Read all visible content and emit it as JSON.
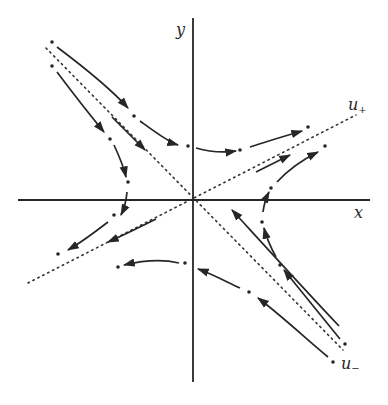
{
  "diagram": {
    "type": "phase-portrait",
    "labels": {
      "y_axis": "y",
      "x_axis": "x",
      "unstable_manifold": "u",
      "unstable_subscript": "+",
      "stable_manifold": "u",
      "stable_subscript": "−"
    },
    "colors": {
      "ink": "#262626",
      "background": "#ffffff"
    },
    "origin": [
      193,
      200
    ],
    "axes": {
      "x": {
        "from": [
          18,
          200
        ],
        "to": [
          370,
          200
        ]
      },
      "y": {
        "from": [
          193,
          18
        ],
        "to": [
          193,
          382
        ]
      }
    },
    "manifolds": {
      "u_plus": {
        "from": [
          28,
          283
        ],
        "to": [
          356,
          115
        ],
        "style": "dotted"
      },
      "u_minus": {
        "from": [
          46,
          48
        ],
        "to": [
          343,
          350
        ],
        "style": "dotted"
      }
    },
    "trajectories": [
      {
        "id": "upper-left-to-upper-right",
        "path": "M56,46 C90,70 110,90 128,110 M140,118 C160,132 170,140 180,146 M198,148 C210,150 225,152 235,152 M248,148 C265,142 285,136 305,130",
        "start_point": [
          52,
          42
        ],
        "mid_points": [
          [
            134,
            115
          ],
          [
            188,
            147
          ],
          [
            240,
            150
          ]
        ],
        "end_point": [
          308,
          126
        ]
      },
      {
        "id": "left-upper-to-left-lower",
        "path": "M56,71 C70,90 90,115 105,133 M113,145 C120,160 125,175 126,185 M127,200 C125,210 122,215 118,219",
        "start_point": [
          52,
          67
        ],
        "mid_points": [
          [
            109,
            139
          ],
          [
            128,
            182
          ]
        ],
        "end_point": [
          118,
          219
        ]
      },
      {
        "id": "along-u-minus-in",
        "path": "M112,117 C130,135 138,143 145,150",
        "start_point": [
          112,
          117
        ],
        "end_point": [
          147,
          153
        ]
      },
      {
        "id": "lower-left-branch",
        "path": "M110,222 C95,235 80,245 66,252",
        "start_point": [
          114,
          215
        ],
        "end_point": [
          58,
          254
        ]
      },
      {
        "id": "along-u-plus-out-left",
        "path": "M156,220 C140,228 125,235 106,243",
        "start_point": [
          156,
          220
        ],
        "end_point": [
          106,
          243
        ]
      },
      {
        "id": "lower-center",
        "path": "M185,264 C170,260 155,261 122,266",
        "start_point": [
          185,
          263
        ],
        "end_point": [
          118,
          267
        ]
      },
      {
        "id": "along-u-plus-out-right",
        "path": "M256,172 C270,165 280,160 288,156",
        "start_point": [
          256,
          172
        ],
        "end_point": [
          288,
          156
        ]
      },
      {
        "id": "right-lower-to-right-upper",
        "path": "M225,220 C240,205 250,190 265,180 M277,174 C285,168 292,163 318,150",
        "start_point": [
          224,
          222
        ],
        "mid_points": [
          [
            270,
            178
          ]
        ],
        "end_point": [
          325,
          145
        ]
      },
      {
        "id": "right-branch",
        "path": "M267,205 C262,213 260,218 260,224",
        "start_point": [
          268,
          198
        ],
        "end_point": [
          261,
          226
        ]
      },
      {
        "id": "lower-right-to-right",
        "path": "M343,340 C320,310 300,290 281,268 M276,257 C270,245 266,236 264,225",
        "start_point": [
          346,
          345
        ],
        "mid_points": [
          [
            278,
            263
          ]
        ],
        "end_point": [
          264,
          224
        ]
      },
      {
        "id": "along-u-minus-in-lower",
        "path": "M339,326 C300,285 270,250 237,215",
        "start_point": [
          342,
          330
        ],
        "end_point": [
          231,
          208
        ]
      },
      {
        "id": "bottom-right-to-y-axis",
        "path": "M328,358 C300,335 275,310 254,296 M245,290 C230,283 215,275 198,270",
        "start_point": [
          333,
          362
        ],
        "mid_points": [
          [
            249,
            292
          ]
        ],
        "end_point": [
          196,
          269
        ]
      }
    ]
  }
}
